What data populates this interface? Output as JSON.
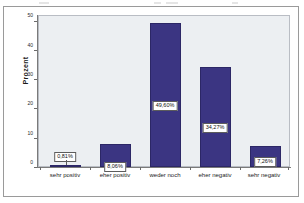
{
  "chart_data": {
    "type": "bar",
    "title": "",
    "subtitle": "",
    "xlabel": "",
    "ylabel": "Prozent",
    "ylim": [
      0,
      52
    ],
    "yticks": [
      "0",
      "10",
      "20",
      "30",
      "40",
      "50"
    ],
    "ytick_values": [
      0,
      10,
      20,
      30,
      40,
      50
    ],
    "grid": false,
    "legend": false,
    "categories": [
      "sehr positiv",
      "eher positiv",
      "weder noch",
      "eher negativ",
      "sehr negativ"
    ],
    "values": [
      0.81,
      8.06,
      49.6,
      34.27,
      7.26
    ],
    "data_labels": [
      "0,81%",
      "8,06%",
      "49,60%",
      "34,27%",
      "7,26%"
    ],
    "bar_color": "#3b3582",
    "bar_border_color": "#2c2766",
    "plot_background": "#eceff2",
    "figure_background": "#ffffff",
    "axis_color": "#7a7a7a",
    "label_box_background": "#ffffff",
    "label_box_border": "#5c5c5c"
  }
}
